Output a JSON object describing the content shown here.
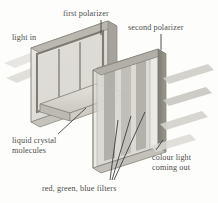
{
  "figure": {
    "background_color": "#fdfdfc",
    "ink_color": "#4d4d4b",
    "labels": {
      "first_polarizer": "first polarizer",
      "second_polarizer": "second polarizer",
      "light_in": "light in",
      "liquid_crystal_molecules": "liquid crystal\nmolecules",
      "liquid_crystal_line1": "liquid crystal",
      "liquid_crystal_line2": "molecules",
      "colour_light_line1": "colour light",
      "colour_light_line2": "coming out",
      "rgb_filters": "red,  green,  blue filters"
    },
    "components": [
      {
        "name": "first-polarizer-panel",
        "role": "polarizing filter plate, left, upright"
      },
      {
        "name": "liquid-crystal-layer",
        "role": "liquid crystal molecule cell between plates"
      },
      {
        "name": "rgb-filter-strips",
        "role": "red green blue vertical colour filter strips"
      },
      {
        "name": "second-polarizer-panel",
        "role": "polarizing filter plate, right, upright"
      },
      {
        "name": "incoming-light-beam",
        "role": "white light entering from the left"
      },
      {
        "name": "outgoing-light-beams",
        "role": "three coloured beams exiting to the right"
      }
    ],
    "palette": {
      "panel_face": "#d8d6d0",
      "panel_face_light": "#e8e7e2",
      "panel_edge": "#8e8b84",
      "panel_dark": "#807d76",
      "filter_dark": "#6f6c66",
      "beam": "#cbc9c3",
      "beam_soft": "#ddDBD5",
      "leader": "#3f3f3d"
    }
  }
}
